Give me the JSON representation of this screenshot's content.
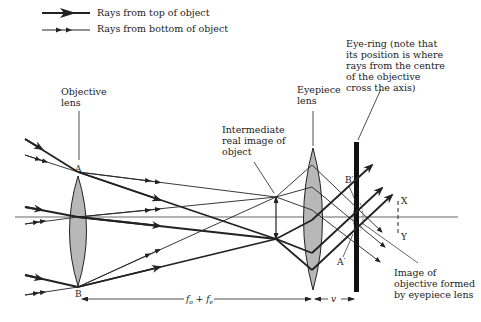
{
  "legend": {
    "items": [
      {
        "label": "Rays from top of object",
        "style": "thick-arrow"
      },
      {
        "label": "Rays from bottom of object",
        "style": "thin-double-arrow"
      }
    ]
  },
  "labels": {
    "objective_lens": [
      "Objective",
      "lens"
    ],
    "eyepiece_lens": [
      "Eyepiece",
      "lens"
    ],
    "intermediate_image": [
      "Intermediate",
      "real image of",
      "object"
    ],
    "eye_ring": [
      "Eye-ring (note that",
      "its position is where",
      "rays from the centre",
      "of the objective",
      "cross the axis)"
    ],
    "image_of_objective": [
      "Image of",
      "objective formed",
      "by eyepiece lens"
    ],
    "point_a": "A",
    "point_b": "B",
    "point_a_prime": "A′",
    "point_b_prime": "B′",
    "point_x": "X",
    "point_y": "Y"
  },
  "dimensions": {
    "focal_sum": "f₀ + fₑ",
    "focal_sum_parts": {
      "f1": "f",
      "sub1": "o",
      "plus": " + ",
      "f2": "f",
      "sub2": "e"
    },
    "eye_distance": "v"
  },
  "colors": {
    "ray": "#222222",
    "lens_fill": "#b8b8b8",
    "axis": "#555555",
    "eye_ring_bar": "#111111"
  }
}
